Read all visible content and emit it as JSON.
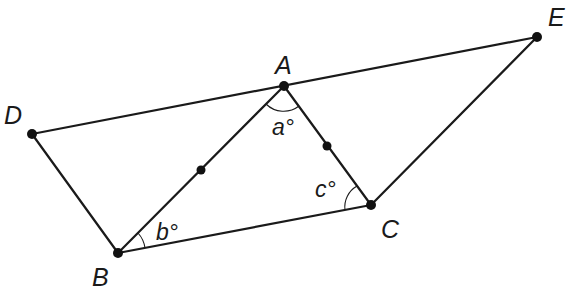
{
  "diagram": {
    "title": "",
    "points": {
      "A": {
        "label": "A",
        "x": 284,
        "y": 86
      },
      "B": {
        "label": "B",
        "x": 118,
        "y": 253
      },
      "C": {
        "label": "C",
        "x": 371,
        "y": 205
      },
      "D": {
        "label": "D",
        "x": 32,
        "y": 134
      },
      "E": {
        "label": "E",
        "x": 537,
        "y": 37
      },
      "M_AB": {
        "label": "",
        "x": 201,
        "y": 170
      },
      "M_AC": {
        "label": "",
        "x": 327,
        "y": 146
      }
    },
    "segments": [
      "D-E",
      "D-B",
      "B-C",
      "C-E",
      "A-B",
      "A-C"
    ],
    "angles": {
      "a": {
        "label": "a°",
        "vertex": "A"
      },
      "b": {
        "label": "b°",
        "vertex": "B"
      },
      "c": {
        "label": "c°",
        "vertex": "C"
      }
    },
    "midpoints": [
      "AB",
      "AC"
    ],
    "colors": {
      "stroke": "#1a1a1a",
      "background": "#ffffff"
    }
  }
}
